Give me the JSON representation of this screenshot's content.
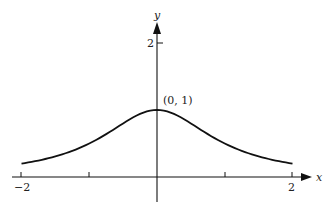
{
  "chart_data": {
    "type": "line",
    "title": "",
    "function": "y = 1/(1+x^2)",
    "xlabel": "x",
    "ylabel": "y",
    "xlim": [
      -2,
      2
    ],
    "ylim": [
      0,
      2
    ],
    "x_ticks": [
      -2,
      -1,
      1,
      2
    ],
    "x_tick_labels": [
      "−2",
      "2"
    ],
    "y_ticks": [
      2
    ],
    "y_tick_labels": [
      "2"
    ],
    "annotations": [
      {
        "text": "(0, 1)",
        "x": 0,
        "y": 1
      }
    ],
    "grid": false,
    "legend": null,
    "series": [
      {
        "name": "curve",
        "x": [
          -2,
          -1.5,
          -1,
          -0.5,
          0,
          0.5,
          1,
          1.5,
          2
        ],
        "values": [
          0.2,
          0.308,
          0.5,
          0.8,
          1,
          0.8,
          0.5,
          0.308,
          0.2
        ]
      }
    ]
  },
  "labels": {
    "x_axis": "x",
    "y_axis": "y",
    "x_min": "−2",
    "x_max": "2",
    "y_tick": "2",
    "point": "(0, 1)"
  }
}
